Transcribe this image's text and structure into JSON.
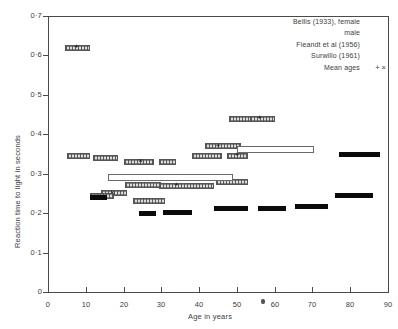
{
  "chart_data": {
    "type": "bar",
    "orientation": "horizontal-range",
    "title": "",
    "xlabel": "Age in years",
    "ylabel": "Reaction time to light in seconds",
    "xlim": [
      0,
      90
    ],
    "ylim": [
      0,
      0.7
    ],
    "xticks": [
      0,
      10,
      20,
      30,
      40,
      50,
      60,
      70,
      80,
      90
    ],
    "xtick_labels": [
      "0",
      "10",
      "20",
      "30",
      "40",
      "50",
      "60",
      "70",
      "80",
      "90"
    ],
    "yticks": [
      0,
      0.1,
      0.2,
      0.3,
      0.4,
      0.5,
      0.6,
      0.7
    ],
    "ytick_labels": [
      "0",
      "0·1",
      "0·2",
      "0·3",
      "0·4",
      "0·5",
      "0·6",
      "0·7"
    ],
    "grid": false,
    "legend_position": "top-right",
    "series": [
      {
        "name": "Bellis (1933), female",
        "style": "hatched",
        "bars": [
          {
            "age_start": 4.5,
            "age_end": 11.0,
            "reaction_time": 0.62,
            "mean_age": 7.5
          },
          {
            "age_start": 5.0,
            "age_end": 11.0,
            "reaction_time": 0.345
          },
          {
            "age_start": 12.0,
            "age_end": 18.5,
            "reaction_time": 0.34
          },
          {
            "age_start": 20.0,
            "age_end": 28.0,
            "reaction_time": 0.33,
            "mean_age": 24.5
          },
          {
            "age_start": 29.5,
            "age_end": 34.0,
            "reaction_time": 0.33
          },
          {
            "age_start": 38.0,
            "age_end": 46.0,
            "reaction_time": 0.345
          },
          {
            "age_start": 47.5,
            "age_end": 53.0,
            "reaction_time": 0.345,
            "mean_age": 50.0
          },
          {
            "age_start": 48.0,
            "age_end": 56.0,
            "reaction_time": 0.44
          },
          {
            "age_start": 53.5,
            "age_end": 60.0,
            "reaction_time": 0.44,
            "mean_age": 56.0
          },
          {
            "age_start": 14.0,
            "age_end": 21.0,
            "reaction_time": 0.25,
            "mean_age": 17.0
          },
          {
            "age_start": 22.5,
            "age_end": 31.0,
            "reaction_time": 0.232
          },
          {
            "age_start": 11.0,
            "age_end": 17.5,
            "reaction_time": 0.243
          }
        ]
      },
      {
        "name": "Bellis (1933), male",
        "style": "hatched",
        "bars": [
          {
            "age_start": 29.5,
            "age_end": 44.0,
            "reaction_time": 0.27,
            "mean_age": 34.0
          },
          {
            "age_start": 44.5,
            "age_end": 53.0,
            "reaction_time": 0.28
          },
          {
            "age_start": 41.5,
            "age_end": 51.0,
            "reaction_time": 0.37,
            "mean_age": 45.0
          },
          {
            "age_start": 20.5,
            "age_end": 30.0,
            "reaction_time": 0.272
          }
        ]
      },
      {
        "name": "Fieandt et al (1956)",
        "style": "solid-black",
        "bars": [
          {
            "age_start": 11.0,
            "age_end": 15.5,
            "reaction_time": 0.24
          },
          {
            "age_start": 24.0,
            "age_end": 28.5,
            "reaction_time": 0.2
          },
          {
            "age_start": 30.5,
            "age_end": 38.0,
            "reaction_time": 0.202
          },
          {
            "age_start": 44.0,
            "age_end": 53.0,
            "reaction_time": 0.213
          },
          {
            "age_start": 55.5,
            "age_end": 63.0,
            "reaction_time": 0.212
          },
          {
            "age_start": 65.5,
            "age_end": 74.0,
            "reaction_time": 0.218
          },
          {
            "age_start": 76.0,
            "age_end": 86.0,
            "reaction_time": 0.245
          },
          {
            "age_start": 77.0,
            "age_end": 88.0,
            "reaction_time": 0.35
          }
        ]
      },
      {
        "name": "Surwillo (1961)",
        "style": "open-box",
        "bars": [
          {
            "age_start": 16.0,
            "age_end": 49.0,
            "reaction_time": 0.29
          },
          {
            "age_start": 50.0,
            "age_end": 70.5,
            "reaction_time": 0.362
          }
        ]
      }
    ],
    "mean_age_markers": {
      "plus": "+",
      "cross": "×"
    }
  },
  "axes": {
    "ylabel": "Reaction time to light in seconds",
    "xlabel": "Age in years",
    "ytick_labels": [
      "0·7",
      "0·6",
      "0·5",
      "0·4",
      "0·3",
      "0·2",
      "0·1",
      "0"
    ],
    "xtick_labels": [
      "0",
      "10",
      "20",
      "30",
      "40",
      "50",
      "60",
      "70",
      "80",
      "90"
    ]
  },
  "legend": {
    "items": [
      {
        "label": "Bellis (1933), female",
        "swatch": "hatched-box"
      },
      {
        "label": "male",
        "swatch": "hatched-box"
      },
      {
        "label": "Fieandt et al (1956)",
        "swatch": "solid-black-box"
      },
      {
        "label": "Surwillo (1961)",
        "swatch": "open-box"
      },
      {
        "label": "Mean ages",
        "swatch": "plus-cross-symbols"
      }
    ],
    "mean_symbols": "+ ×"
  },
  "colors": {
    "axis": "#4a4a4a",
    "text": "#3c3c3c",
    "solid_fill": "#0b0b0b",
    "hatch_fill": "#dcdcdc",
    "open_fill": "#ffffff",
    "background": "#ffffff"
  }
}
